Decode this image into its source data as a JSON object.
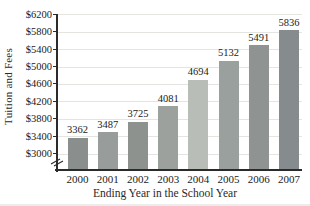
{
  "figure": {
    "background": "#ffffff"
  },
  "chart_data": {
    "type": "bar",
    "title": "",
    "xlabel": "Ending Year in the School Year",
    "ylabel": "Tuition and Fees",
    "categories": [
      "2000",
      "2001",
      "2002",
      "2003",
      "2004",
      "2005",
      "2006",
      "2007"
    ],
    "values": [
      3362,
      3487,
      3725,
      4081,
      4694,
      5132,
      5491,
      5836
    ],
    "value_labels": [
      "3362",
      "3487",
      "3725",
      "4081",
      "4694",
      "5132",
      "5491",
      "5836"
    ],
    "y_ticks": [
      3000,
      3400,
      3800,
      4200,
      4600,
      5000,
      5400,
      5800,
      6200
    ],
    "y_tick_labels": [
      "$3000",
      "$3400",
      "$3800",
      "$4200",
      "$4600",
      "$5000",
      "$5400",
      "$5800",
      "$6200"
    ],
    "ylim": [
      3000,
      6200
    ],
    "axis_break_below_min": true,
    "grid": "horizontal",
    "legend": "none",
    "highlight_category": "2004",
    "bar_colors": [
      "#8a8f8d",
      "#989c9a",
      "#8e928f",
      "#9da19e",
      "#b8bdb8",
      "#9aa09e",
      "#8f9492",
      "#868b8d"
    ]
  },
  "colors": {
    "bar_default": "#8f9392",
    "bar_highlight": "#b8bdb8",
    "grid": "#e4e4e1",
    "axis": "#2b2b2b",
    "text": "#1b1b1b"
  }
}
